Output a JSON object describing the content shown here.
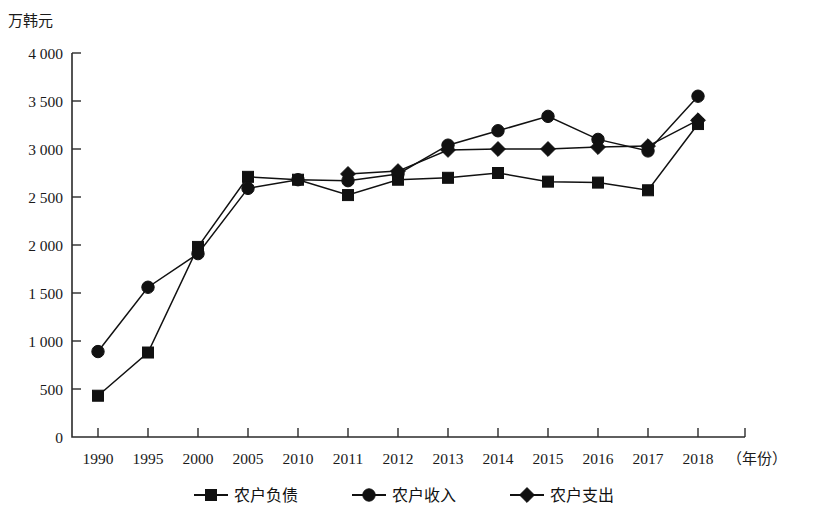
{
  "chart_data": {
    "type": "line",
    "title": "",
    "ylabel": "万韩元",
    "xlabel": "（年份）",
    "ylim": [
      0,
      4000
    ],
    "ytick_step": 500,
    "ytick_labels": [
      "0",
      "500",
      "1 000",
      "1 500",
      "2 000",
      "2 500",
      "3 000",
      "3 500",
      "4 000"
    ],
    "ytick_values": [
      0,
      500,
      1000,
      1500,
      2000,
      2500,
      3000,
      3500,
      4000
    ],
    "grid": false,
    "legend_position": "bottom",
    "categories": [
      "1990",
      "1995",
      "2000",
      "2005",
      "2010",
      "2011",
      "2012",
      "2013",
      "2014",
      "2015",
      "2016",
      "2017",
      "2018"
    ],
    "series": [
      {
        "name": "农户负债",
        "marker": "square",
        "color": "#111111",
        "values": [
          430,
          880,
          1980,
          2710,
          2680,
          2520,
          2680,
          2700,
          2750,
          2660,
          2650,
          2570,
          3260
        ]
      },
      {
        "name": "农户收入",
        "marker": "circle",
        "color": "#111111",
        "values": [
          890,
          1560,
          1910,
          2590,
          2680,
          2670,
          2740,
          3040,
          3190,
          3340,
          3100,
          2980,
          3550
        ]
      },
      {
        "name": "农户支出",
        "marker": "diamond",
        "color": "#111111",
        "values": [
          null,
          null,
          null,
          null,
          null,
          2740,
          2770,
          2990,
          3000,
          3000,
          3020,
          3030,
          3300
        ]
      }
    ]
  },
  "legend": {
    "items": [
      {
        "label": "农户负债",
        "marker": "square"
      },
      {
        "label": "农户收入",
        "marker": "circle"
      },
      {
        "label": "农户支出",
        "marker": "diamond"
      }
    ]
  }
}
